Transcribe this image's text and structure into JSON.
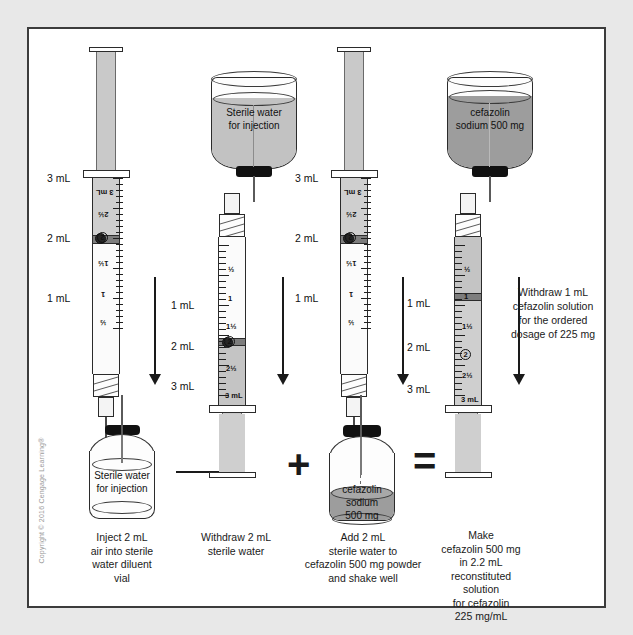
{
  "figure": {
    "copyright": "Copyright © 2016 Cengage Learning®"
  },
  "scale_labels": {
    "ml1": "1 mL",
    "ml2": "2 mL",
    "ml3": "3 mL"
  },
  "syringe_scale": {
    "half": "½",
    "one": "1",
    "one_half": "1½",
    "two": "2",
    "two_half": "2½",
    "three": "3 mL"
  },
  "steps": [
    {
      "id": "step-1",
      "caption": "Inject 2 mL\nair into sterile\nwater diluent\nvial",
      "caption_lines": [
        "Inject 2 mL",
        "air into sterile",
        "water diluent",
        "vial"
      ],
      "vial_label_lines": [
        "Sterile water",
        "for injection"
      ],
      "syringe_state": "air-2ml-inverted"
    },
    {
      "id": "step-2",
      "caption_lines": [
        "Withdraw 2 mL",
        "sterile water"
      ],
      "bottle_label_lines": [
        "Sterile water",
        "for injection"
      ],
      "syringe_state": "water-2ml-upright"
    },
    {
      "id": "step-3",
      "caption_lines": [
        "Add 2 mL",
        "sterile water to",
        "cefazolin 500 mg powder",
        "and shake well"
      ],
      "vial_label_lines": [
        "cefazolin",
        "sodium",
        "500 mg"
      ],
      "syringe_state": "air-2ml-inverted"
    },
    {
      "id": "step-4",
      "caption_lines": [
        "Make",
        "cefazolin 500 mg",
        "in 2.2 mL",
        "reconstituted",
        "solution",
        "for cefazolin",
        "225 mg/mL"
      ],
      "bottle_label_lines": [
        "cefazolin",
        "sodium 500 mg"
      ],
      "syringe_state": "solution-1ml-upright",
      "sidenote_lines": [
        "Withdraw 1 mL",
        "cefazolin solution",
        "for the ordered",
        "dosage of 225 mg"
      ]
    }
  ],
  "operators": {
    "arrow_right": "→",
    "plus": "+",
    "equals": "=",
    "arrow_down": "↓"
  },
  "colors": {
    "frame_border": "#3c3c3c",
    "page_background": "#e8e8e8",
    "figure_background": "#ffffff",
    "liquid_light": "#c2c2c2",
    "liquid_dark": "#9d9d9d",
    "ink": "#1a1a1a",
    "cap_black": "#111111"
  }
}
